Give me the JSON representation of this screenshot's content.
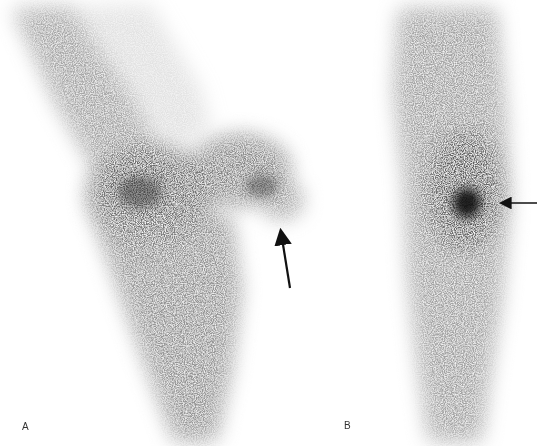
{
  "figure": {
    "type": "bone scintigraphy",
    "panels": [
      {
        "label": "A",
        "arrow": {
          "direction": "up",
          "tail": [
            290,
            288
          ],
          "head": [
            279,
            224
          ]
        }
      },
      {
        "label": "B",
        "arrow": {
          "direction": "left",
          "tail": [
            537,
            203
          ],
          "head": [
            495,
            203
          ]
        }
      }
    ]
  },
  "colors": {
    "background": "#ffffff",
    "uptake_dark": "#1a1a1a",
    "uptake_mid": "#6a6a6a",
    "uptake_light": "#b5b5b5",
    "arrow": "#111111"
  }
}
